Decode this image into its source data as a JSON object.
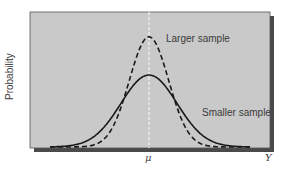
{
  "chart_data": {
    "type": "line",
    "title": "",
    "xlabel": "Ȳ",
    "ylabel": "Probability",
    "x_ticks": [
      {
        "label": "μ",
        "position": "center"
      }
    ],
    "x_axis_end_label": "Ȳ",
    "grid": false,
    "legend": "inline annotations",
    "reference_line": {
      "label": "μ",
      "style": "dashed vertical (white)",
      "x": 0
    },
    "series": [
      {
        "name": "Larger sample",
        "style": "dashed",
        "color": "#1a1a1a",
        "distribution": "normal",
        "mean": 0,
        "relative_std": 0.7,
        "relative_peak": 1.53
      },
      {
        "name": "Smaller sample",
        "style": "solid",
        "color": "#1a1a1a",
        "distribution": "normal",
        "mean": 0,
        "relative_std": 1.0,
        "relative_peak": 1.0
      }
    ],
    "annotations": [
      {
        "text": "Larger sample",
        "near": "peak of dashed curve, right side"
      },
      {
        "text": "Smaller sample",
        "near": "right tail of solid curve"
      }
    ]
  },
  "labels": {
    "ylabel": "Probability",
    "larger": "Larger sample",
    "smaller": "Smaller sample",
    "mu": "μ",
    "ybar": "Y"
  },
  "colors": {
    "plot_bg": "#c9c9c9",
    "frame_shadow": "#4a4a4a",
    "curve": "#1a1a1a",
    "reference_line": "#f4f4f4"
  }
}
